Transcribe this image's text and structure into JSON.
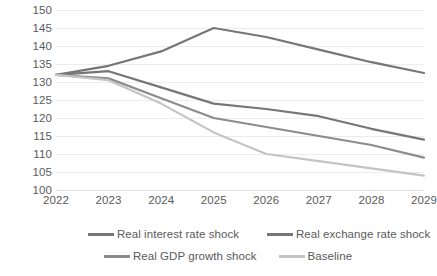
{
  "chart_data": {
    "type": "line",
    "title": "",
    "subtitle": "",
    "xlabel": "",
    "ylabel": "",
    "categories": [
      "2022",
      "2023",
      "2024",
      "2025",
      "2026",
      "2027",
      "2028",
      "2029"
    ],
    "ylim": [
      100,
      150
    ],
    "y_ticks": [
      150,
      145,
      140,
      135,
      130,
      125,
      120,
      115,
      110,
      105,
      100
    ],
    "grid": true,
    "legend_position": "bottom",
    "series": [
      {
        "name": "Real interest rate shock",
        "color": "#767676",
        "values": [
          132,
          134.5,
          138.5,
          145,
          142.5,
          139,
          135.5,
          132.5
        ]
      },
      {
        "name": "Real exchange rate shock",
        "color": "#767676",
        "values": [
          132,
          133,
          128.5,
          124,
          122.5,
          120.5,
          117,
          114
        ]
      },
      {
        "name": "Real GDP growth  shock",
        "color": "#8c8c8c",
        "values": [
          132,
          131,
          125.5,
          120,
          117.5,
          115,
          112.5,
          109
        ]
      },
      {
        "name": "Baseline",
        "color": "#c4c4c4",
        "values": [
          132,
          130.5,
          124,
          116,
          110,
          108,
          106,
          104
        ]
      }
    ]
  },
  "legend": {
    "items": [
      {
        "label": "Real interest rate shock",
        "color": "#767676"
      },
      {
        "label": "Real exchange rate shock",
        "color": "#767676"
      },
      {
        "label": "Real GDP growth  shock",
        "color": "#8c8c8c"
      },
      {
        "label": "Baseline",
        "color": "#c4c4c4"
      }
    ]
  }
}
